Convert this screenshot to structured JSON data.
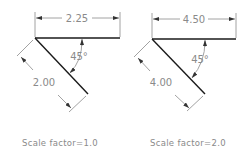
{
  "diagram": {
    "panels": [
      {
        "id": "left",
        "horizontal_dimension": "2.25",
        "angle": "45°",
        "aligned_dimension": "2.00",
        "caption": "Scale factor=1.0"
      },
      {
        "id": "right",
        "horizontal_dimension": "4.50",
        "angle": "45°",
        "aligned_dimension": "4.00",
        "caption": "Scale factor=2.0"
      }
    ],
    "colors": {
      "object_line": "#1a1a1a",
      "dimension_line": "#8a8a8a",
      "background": "#ffffff"
    }
  }
}
